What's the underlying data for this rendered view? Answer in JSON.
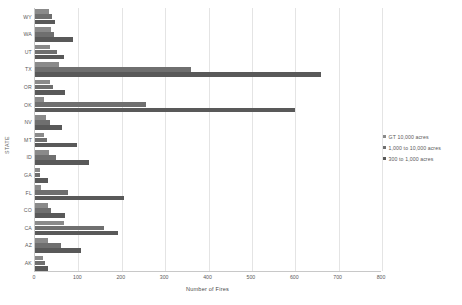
{
  "chart_data": {
    "type": "bar",
    "orientation": "horizontal",
    "title": "",
    "xlabel": "Number of Fires",
    "ylabel": "STATE",
    "xlim": [
      0,
      800
    ],
    "xticks": [
      0,
      100,
      200,
      300,
      400,
      500,
      600,
      700,
      800
    ],
    "xtick_labels": [
      "0",
      "100",
      "200",
      "300",
      "400",
      "500",
      "600",
      "700",
      "800"
    ],
    "grid": "vertical",
    "legend_position": "right",
    "categories": [
      "WY",
      "WA",
      "UT",
      "TX",
      "OR",
      "OK",
      "NV",
      "MT",
      "ID",
      "GA",
      "FL",
      "CO",
      "CA",
      "AZ",
      "AK"
    ],
    "series": [
      {
        "name": "GT 10,000 acres",
        "color": "#8a8a8a",
        "values": [
          33,
          38,
          34,
          55,
          34,
          20,
          26,
          20,
          33,
          11,
          13,
          29,
          68,
          31,
          19
        ]
      },
      {
        "name": "1,000 to 10,000 acres",
        "color": "#6f6f6f",
        "values": [
          40,
          43,
          50,
          360,
          42,
          255,
          35,
          27,
          48,
          12,
          75,
          38,
          160,
          60,
          22
        ]
      },
      {
        "name": "300 to 1,000 acres",
        "color": "#595959",
        "values": [
          47,
          87,
          66,
          660,
          69,
          600,
          62,
          97,
          125,
          29,
          205,
          69,
          191,
          105,
          29
        ]
      }
    ]
  },
  "legend": {
    "entries": [
      {
        "label": "GT 10,000 acres",
        "color": "#8a8a8a"
      },
      {
        "label": "1,000 to 10,000 acres",
        "color": "#6f6f6f"
      },
      {
        "label": "300 to 1,000 acres",
        "color": "#595959"
      }
    ]
  }
}
